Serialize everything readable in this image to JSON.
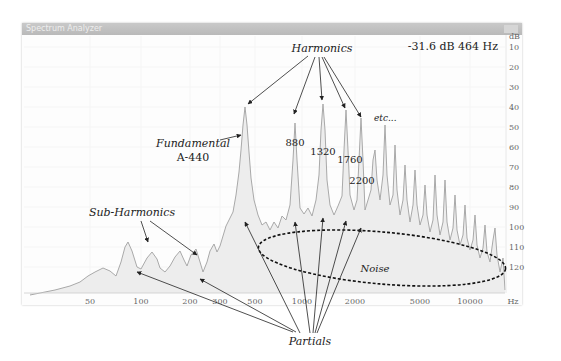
{
  "window": {
    "title": "Spectrum Analyzer"
  },
  "readout": "-31.6 dB 464 Hz",
  "colors": {
    "spectrum_line": "#a9a9a9",
    "spectrum_fill": "#ededed",
    "annotation": "#222222",
    "axis_text": "#666666",
    "grid": "#f2f2f2"
  },
  "annotations": {
    "harmonics": "Harmonics",
    "fundamental_line1": "Fundamental",
    "fundamental_line2": "A-440",
    "etc": "etc...",
    "sub_harmonics": "Sub-Harmonics",
    "noise": "Noise",
    "partials": "Partials",
    "h880": "880",
    "h1320": "1320",
    "h1760": "1760",
    "h2200": "2200"
  },
  "chart_data": {
    "type": "line",
    "title": "Spectrum Analyzer",
    "xlabel": "Hz",
    "ylabel": "dB",
    "x_scale": "log",
    "xlim": [
      20,
      20000
    ],
    "ylim": [
      130,
      0
    ],
    "y_inverted": true,
    "grid": true,
    "x_ticks": [
      {
        "label": "50",
        "x": 90
      },
      {
        "label": "100",
        "x": 141
      },
      {
        "label": "200",
        "x": 190
      },
      {
        "label": "300",
        "x": 220
      },
      {
        "label": "500",
        "x": 255
      },
      {
        "label": "1000",
        "x": 302
      },
      {
        "label": "2000",
        "x": 355
      },
      {
        "label": "5000",
        "x": 420
      },
      {
        "label": "10000",
        "x": 470
      },
      {
        "label": "Hz",
        "x": 513
      }
    ],
    "y_ticks": [
      {
        "label": "dB",
        "y": 39
      },
      {
        "label": "10",
        "y": 50
      },
      {
        "label": "20",
        "y": 70
      },
      {
        "label": "30",
        "y": 90
      },
      {
        "label": "40",
        "y": 110
      },
      {
        "label": "50",
        "y": 130
      },
      {
        "label": "60",
        "y": 150
      },
      {
        "label": "70",
        "y": 170
      },
      {
        "label": "80",
        "y": 190
      },
      {
        "label": "90",
        "y": 210
      },
      {
        "label": "100",
        "y": 230
      },
      {
        "label": "110",
        "y": 250
      },
      {
        "label": "120",
        "y": 270
      }
    ],
    "cursor_readout": {
      "level_db": -31.6,
      "freq_hz": 464
    },
    "labeled_peaks": [
      {
        "name": "Fundamental A-440",
        "freq_hz": 440,
        "level_db": 36
      },
      {
        "name": "880",
        "freq_hz": 880,
        "level_db": 44
      },
      {
        "name": "1320",
        "freq_hz": 1320,
        "level_db": 39
      },
      {
        "name": "1760",
        "freq_hz": 1760,
        "level_db": 41
      },
      {
        "name": "2200",
        "freq_hz": 2200,
        "level_db": 43
      }
    ],
    "sub_harmonic_peaks_hz": [
      110,
      220
    ],
    "spectrum_points": [
      [
        30,
        295
      ],
      [
        55,
        290
      ],
      [
        70,
        286
      ],
      [
        80,
        282
      ],
      [
        88,
        276
      ],
      [
        95,
        272
      ],
      [
        103,
        268
      ],
      [
        110,
        271
      ],
      [
        116,
        276
      ],
      [
        121,
        262
      ],
      [
        125,
        247
      ],
      [
        128,
        242
      ],
      [
        132,
        251
      ],
      [
        137,
        267
      ],
      [
        141,
        269
      ],
      [
        147,
        258
      ],
      [
        152,
        252
      ],
      [
        157,
        259
      ],
      [
        160,
        268
      ],
      [
        165,
        272
      ],
      [
        170,
        266
      ],
      [
        175,
        257
      ],
      [
        180,
        251
      ],
      [
        184,
        260
      ],
      [
        187,
        266
      ],
      [
        191,
        255
      ],
      [
        196,
        249
      ],
      [
        200,
        262
      ],
      [
        203,
        272
      ],
      [
        207,
        262
      ],
      [
        210,
        251
      ],
      [
        214,
        244
      ],
      [
        217,
        252
      ],
      [
        220,
        246
      ],
      [
        223,
        236
      ],
      [
        226,
        226
      ],
      [
        229,
        220
      ],
      [
        233,
        212
      ],
      [
        236,
        195
      ],
      [
        239,
        172
      ],
      [
        241,
        150
      ],
      [
        243,
        125
      ],
      [
        245,
        107
      ],
      [
        247,
        125
      ],
      [
        249,
        152
      ],
      [
        251,
        178
      ],
      [
        254,
        200
      ],
      [
        258,
        215
      ],
      [
        262,
        225
      ],
      [
        266,
        222
      ],
      [
        270,
        230
      ],
      [
        274,
        222
      ],
      [
        278,
        228
      ],
      [
        282,
        216
      ],
      [
        286,
        220
      ],
      [
        290,
        205
      ],
      [
        293,
        160
      ],
      [
        295,
        123
      ],
      [
        297,
        160
      ],
      [
        300,
        208
      ],
      [
        304,
        214
      ],
      [
        308,
        208
      ],
      [
        312,
        216
      ],
      [
        316,
        200
      ],
      [
        319,
        175
      ],
      [
        321,
        130
      ],
      [
        323,
        104
      ],
      [
        325,
        130
      ],
      [
        327,
        180
      ],
      [
        330,
        205
      ],
      [
        334,
        215
      ],
      [
        338,
        206
      ],
      [
        342,
        196
      ],
      [
        344,
        150
      ],
      [
        346,
        110
      ],
      [
        348,
        150
      ],
      [
        350,
        195
      ],
      [
        354,
        210
      ],
      [
        357,
        200
      ],
      [
        359,
        160
      ],
      [
        361,
        118
      ],
      [
        363,
        160
      ],
      [
        365,
        210
      ],
      [
        368,
        200
      ],
      [
        371,
        190
      ],
      [
        373,
        160
      ],
      [
        375,
        150
      ],
      [
        377,
        180
      ],
      [
        380,
        200
      ],
      [
        383,
        175
      ],
      [
        385,
        125
      ],
      [
        387,
        175
      ],
      [
        390,
        205
      ],
      [
        393,
        195
      ],
      [
        395,
        145
      ],
      [
        397,
        190
      ],
      [
        400,
        215
      ],
      [
        403,
        200
      ],
      [
        405,
        165
      ],
      [
        407,
        200
      ],
      [
        410,
        222
      ],
      [
        413,
        205
      ],
      [
        415,
        170
      ],
      [
        417,
        205
      ],
      [
        420,
        225
      ],
      [
        423,
        215
      ],
      [
        425,
        185
      ],
      [
        427,
        215
      ],
      [
        430,
        232
      ],
      [
        433,
        220
      ],
      [
        435,
        175
      ],
      [
        437,
        215
      ],
      [
        440,
        235
      ],
      [
        443,
        222
      ],
      [
        445,
        180
      ],
      [
        447,
        222
      ],
      [
        450,
        240
      ],
      [
        453,
        228
      ],
      [
        455,
        195
      ],
      [
        457,
        230
      ],
      [
        460,
        245
      ],
      [
        463,
        235
      ],
      [
        465,
        205
      ],
      [
        467,
        238
      ],
      [
        470,
        250
      ],
      [
        473,
        240
      ],
      [
        475,
        215
      ],
      [
        477,
        245
      ],
      [
        480,
        258
      ],
      [
        483,
        248
      ],
      [
        485,
        225
      ],
      [
        487,
        252
      ],
      [
        490,
        262
      ],
      [
        493,
        240
      ],
      [
        495,
        228
      ],
      [
        497,
        255
      ],
      [
        500,
        272
      ],
      [
        503,
        258
      ],
      [
        505,
        290
      ]
    ]
  }
}
